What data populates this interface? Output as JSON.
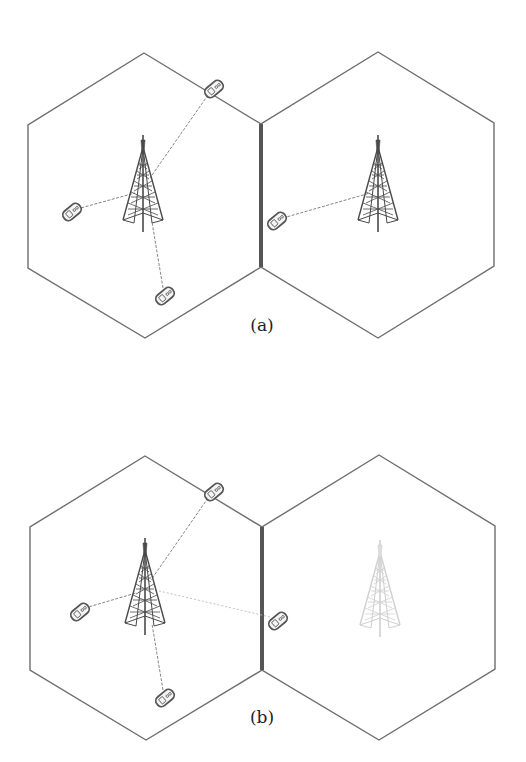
{
  "figure": {
    "colors": {
      "background": "#ffffff",
      "hex_stroke": "#6e6e6e",
      "shared_edge": "#555555",
      "tower": "#4a4a4a",
      "tower_faded": "#c8c8c8",
      "link": "#777777",
      "link_faded": "#bbbbbb",
      "phone": "#555555"
    },
    "panels": [
      {
        "id": "a",
        "label": "(a)",
        "label_pos": [
          262,
          325
        ],
        "cells": [
          {
            "name": "left-cell",
            "center": [
              145,
              195
            ],
            "tower_active": true
          },
          {
            "name": "right-cell",
            "center": [
              378,
              195
            ],
            "tower_active": true
          }
        ],
        "phones": [
          {
            "pos": [
              72,
              212
            ],
            "linked_to": "left-cell"
          },
          {
            "pos": [
              214,
              89
            ],
            "linked_to": "left-cell"
          },
          {
            "pos": [
              165,
              296
            ],
            "linked_to": "left-cell"
          },
          {
            "pos": [
              277,
              221
            ],
            "linked_to": "right-cell"
          }
        ]
      },
      {
        "id": "b",
        "label": "(b)",
        "label_pos": [
          262,
          717
        ],
        "cells": [
          {
            "name": "left-cell",
            "center": [
              146,
              598
            ],
            "tower_active": true
          },
          {
            "name": "right-cell",
            "center": [
              379,
              598
            ],
            "tower_active": false
          }
        ],
        "phones": [
          {
            "pos": [
              80,
              612
            ],
            "linked_to": "left-cell"
          },
          {
            "pos": [
              214,
              492
            ],
            "linked_to": "left-cell"
          },
          {
            "pos": [
              165,
              698
            ],
            "linked_to": "left-cell"
          },
          {
            "pos": [
              278,
              621
            ],
            "linked_to": "left-cell"
          }
        ]
      }
    ]
  }
}
